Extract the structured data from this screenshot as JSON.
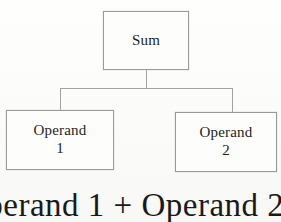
{
  "diagram": {
    "background_color": "#fdfdfb",
    "border_color": "#9a9a9a",
    "text_color": "#1d1d1d",
    "nodes": [
      {
        "id": "sum",
        "line_1": "Sum",
        "line_2": ""
      },
      {
        "id": "operand-1",
        "line_1": "Operand",
        "line_2": "1"
      },
      {
        "id": "operand-2",
        "line_1": "Operand",
        "line_2": "2"
      }
    ],
    "caption": {
      "text": "Operand 1 + Operand 2",
      "clipped": "true"
    }
  }
}
